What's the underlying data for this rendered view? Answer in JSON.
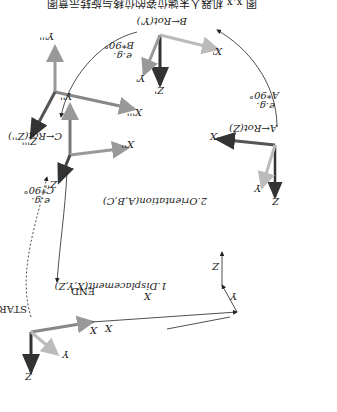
{
  "figure": {
    "orientation": "rotated-180",
    "caption_partial": "图 x.x 机器人末端位姿的位移与旋转示意图",
    "frames": {
      "start": {
        "label": "START",
        "axes": [
          "X",
          "Y",
          "Z"
        ]
      },
      "a": {
        "rotation": "A←Rot(Z)",
        "example": "e.g.",
        "example_value": "A*90°",
        "axes": [
          "X",
          "Y",
          "Z"
        ]
      },
      "b": {
        "rotation": "B←Rot(Y')",
        "example": "e.g.",
        "example_value": "B*90°",
        "axes": [
          "X'",
          "Y'",
          "Z'"
        ]
      },
      "c": {
        "rotation": "C←Rot(Z'')",
        "example": "e.g.",
        "example_value": "C*90°",
        "axes": [
          "X''",
          "Y''",
          "Z''"
        ]
      },
      "end": {
        "label": "END",
        "axes": [
          "X'''",
          "Y'''",
          "Z'''"
        ]
      }
    },
    "displacement_label": "1.Displacement(X,Y,Z)",
    "orientation_label": "2.Orientation(A,B,C)",
    "path_labels": {
      "x1": "X",
      "x2": "X",
      "y": "Y",
      "z": "Z"
    }
  }
}
